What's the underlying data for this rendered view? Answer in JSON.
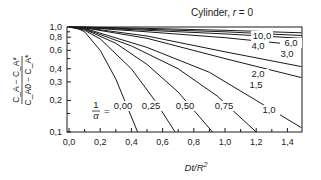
{
  "chart_data": {
    "type": "line",
    "title": "Cylinder, r = 0",
    "title_parts": {
      "prefix": "Cylinder, ",
      "var": "r",
      "suffix": " = 0"
    },
    "xlabel": "Dt/R²",
    "xlabel_parts": {
      "a": "Dt/R",
      "sup": "2"
    },
    "ylabel": "(C_A − C_A*) / (C_A0 − C_A*)",
    "ylabel_parts": {
      "num": "C_A − C_A*",
      "den": "C_A0 − C_A*"
    },
    "xscale": "linear",
    "yscale": "log",
    "xlim": [
      0.0,
      1.49
    ],
    "ylim": [
      0.1,
      1.0
    ],
    "grid": false,
    "legend": "none (curves labeled inline)",
    "parameter_label": "1/α =",
    "x_ticks": [
      "0.0",
      "0.2",
      "0.4",
      "0.6",
      "0.8",
      "1.0",
      "1.2",
      "1.4"
    ],
    "x_tick_values": [
      0.0,
      0.2,
      0.4,
      0.6,
      0.8,
      1.0,
      1.2,
      1.4
    ],
    "y_ticks": [
      "1.0",
      "0.8",
      "0.6",
      "0.4",
      "0.3",
      "0.2",
      "0.1"
    ],
    "y_tick_values": [
      1.0,
      0.8,
      0.6,
      0.4,
      0.3,
      0.2,
      0.1
    ],
    "series": [
      {
        "name": "0.00",
        "label": "0.00",
        "x": [
          0.0,
          0.05,
          0.1,
          0.2,
          0.3,
          0.44
        ],
        "y": [
          1.0,
          0.98,
          0.9,
          0.6,
          0.32,
          0.1
        ]
      },
      {
        "name": "0.25",
        "label": "0.25",
        "x": [
          0.0,
          0.1,
          0.2,
          0.4,
          0.55,
          0.68
        ],
        "y": [
          1.0,
          0.93,
          0.77,
          0.4,
          0.2,
          0.1
        ]
      },
      {
        "name": "0.50",
        "label": "0.50",
        "x": [
          0.0,
          0.1,
          0.3,
          0.5,
          0.7,
          0.92
        ],
        "y": [
          1.0,
          0.95,
          0.7,
          0.44,
          0.24,
          0.1
        ]
      },
      {
        "name": "0.75",
        "label": "0.75",
        "x": [
          0.0,
          0.1,
          0.4,
          0.7,
          0.95,
          1.2
        ],
        "y": [
          1.0,
          0.96,
          0.66,
          0.4,
          0.22,
          0.1
        ]
      },
      {
        "name": "1.0",
        "label": "1.0",
        "x": [
          0.0,
          0.1,
          0.5,
          0.9,
          1.2,
          1.49
        ],
        "y": [
          1.0,
          0.97,
          0.64,
          0.37,
          0.2,
          0.11
        ]
      },
      {
        "name": "1.5",
        "label": "1.5",
        "x": [
          0.0,
          0.1,
          0.5,
          1.0,
          1.49
        ],
        "y": [
          1.0,
          0.98,
          0.78,
          0.5,
          0.33
        ]
      },
      {
        "name": "2.0",
        "label": "2.0",
        "x": [
          0.0,
          0.1,
          0.5,
          1.0,
          1.49
        ],
        "y": [
          1.0,
          0.985,
          0.82,
          0.58,
          0.42
        ]
      },
      {
        "name": "3.0",
        "label": "3.0",
        "x": [
          0.0,
          0.1,
          0.5,
          1.0,
          1.49
        ],
        "y": [
          1.0,
          0.99,
          0.9,
          0.79,
          0.67
        ]
      },
      {
        "name": "4.0",
        "label": "4.0",
        "x": [
          0.0,
          0.1,
          0.5,
          1.0,
          1.49
        ],
        "y": [
          1.0,
          0.99,
          0.93,
          0.86,
          0.78
        ]
      },
      {
        "name": "6.0",
        "label": "6.0",
        "x": [
          0.0,
          0.1,
          0.5,
          1.0,
          1.49
        ],
        "y": [
          1.0,
          0.995,
          0.95,
          0.9,
          0.83
        ]
      },
      {
        "name": "10.0",
        "label": "10.0",
        "x": [
          0.0,
          0.1,
          0.5,
          1.0,
          1.49
        ],
        "y": [
          1.0,
          0.997,
          0.97,
          0.93,
          0.88
        ]
      }
    ],
    "colors": {
      "line": "#1a1a1a",
      "background": "#ffffff"
    }
  }
}
